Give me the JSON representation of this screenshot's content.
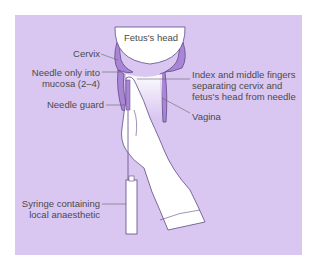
{
  "diagram": {
    "colors": {
      "background": "#d9c7f2",
      "tissue": "#a985d6",
      "outline": "#5e4a86",
      "glove": "#ffffff",
      "text": "#4a4a4a"
    },
    "labels": {
      "fetus_head": "Fetus's head",
      "cervix": "Cervix",
      "needle_line1": "Needle only into",
      "needle_line2": "mucosa (2–4)",
      "needle_guard": "Needle guard",
      "fingers_line1": "Index and middle fingers",
      "fingers_line2": "separating cervix and",
      "fingers_line3": "fetus's head from needle",
      "vagina": "Vagina",
      "syringe_line1": "Syringe containing",
      "syringe_line2": "local anaesthetic"
    }
  }
}
